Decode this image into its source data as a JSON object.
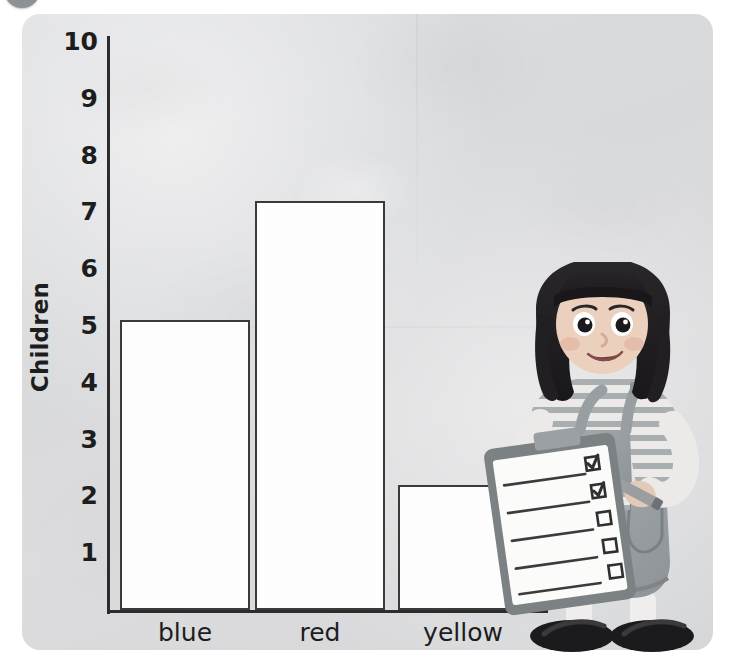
{
  "badge": {
    "name": "activity-number-badge",
    "color": "#8d9196"
  },
  "colors": {
    "page_background": "#d9dadc",
    "bar_fill": "#fdfdfd",
    "bar_stroke": "#3a3a3a",
    "axis": "#2c2c2c",
    "text": "#1d1d1d",
    "girl_hair": "#211f22",
    "girl_overalls": "#9aa0a3",
    "girl_shirt": "#e9e9ea",
    "clipboard_board": "#7c8184",
    "shoe": "#1b1b1d"
  },
  "chart_data": {
    "type": "bar",
    "title": "",
    "xlabel": "",
    "ylabel": "Children",
    "categories": [
      "blue",
      "red",
      "yellow"
    ],
    "values": [
      5.1,
      7.2,
      2.2
    ],
    "ylim": [
      0,
      10
    ],
    "ytick_labels": [
      "10",
      "9",
      "8",
      "7",
      "6",
      "5",
      "4",
      "3",
      "2",
      "1"
    ],
    "ytick_values": [
      10,
      9,
      8,
      7,
      6,
      5,
      4,
      3,
      2,
      1
    ],
    "grid": false,
    "legend": false
  },
  "illustration": {
    "name": "girl-with-clipboard",
    "description": "Girl with dark bob haircut holding a clipboard and pencil",
    "clipboard": {
      "rows": 5,
      "checkboxes": 5,
      "checked": 2
    }
  }
}
